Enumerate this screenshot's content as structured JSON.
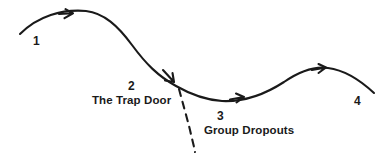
{
  "diagram": {
    "type": "flow-curve",
    "background_color": "#ffffff",
    "stroke_color": "#1a1a1a",
    "text_color": "#1a1a1a",
    "stages": [
      {
        "number": "1",
        "caption": ""
      },
      {
        "number": "2",
        "caption": "The Trap Door"
      },
      {
        "number": "3",
        "caption": "Group Dropouts"
      },
      {
        "number": "4",
        "caption": ""
      }
    ],
    "labels": {
      "one": "1",
      "two": "2",
      "three": "3",
      "four": "4",
      "trap_door": "The Trap Door",
      "group_dropouts": "Group Dropouts"
    },
    "paths": {
      "main_curve_style": "solid",
      "branch_style": "dashed",
      "arrow_count": "3"
    }
  }
}
